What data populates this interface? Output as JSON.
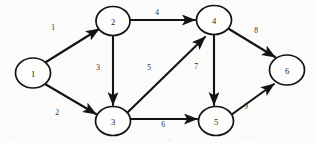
{
  "figure": {
    "type": "directed-weighted-graph",
    "background_color": "#fbfbfa",
    "ink_color": "#131313",
    "width": 317,
    "height": 143
  },
  "nodes": [
    {
      "id": "1",
      "label": "1",
      "cx": 33,
      "cy": 73,
      "rx": 17.5,
      "ry": 15.0
    },
    {
      "id": "2",
      "label": "2",
      "cx": 113,
      "cy": 21,
      "rx": 17.0,
      "ry": 14.5
    },
    {
      "id": "3",
      "label": "3",
      "cx": 113,
      "cy": 121,
      "rx": 17.5,
      "ry": 14.5
    },
    {
      "id": "4",
      "label": "4",
      "cx": 214,
      "cy": 20,
      "rx": 17.5,
      "ry": 14.5
    },
    {
      "id": "5",
      "label": "5",
      "cx": 216,
      "cy": 121,
      "rx": 17.5,
      "ry": 14.5
    },
    {
      "id": "6",
      "label": "6",
      "cx": 287,
      "cy": 70,
      "rx": 17.5,
      "ry": 15.0
    }
  ],
  "edges": [
    {
      "id": "e1",
      "from": "1",
      "to": "2",
      "weight": "1",
      "label_x": 53,
      "label_y": 27,
      "x1": 46,
      "y1": 62,
      "x2": 99,
      "y2": 29
    },
    {
      "id": "e2",
      "from": "1",
      "to": "3",
      "weight": "2",
      "label_x": 57,
      "label_y": 112,
      "x1": 45,
      "y1": 84,
      "x2": 96,
      "y2": 114
    },
    {
      "id": "e3",
      "from": "2",
      "to": "3",
      "weight": "3",
      "label_x": 98,
      "label_y": 67,
      "x1": 113,
      "y1": 36,
      "x2": 113,
      "y2": 105
    },
    {
      "id": "e4",
      "from": "2",
      "to": "4",
      "weight": "4",
      "label_x": 157,
      "label_y": 12,
      "x1": 130,
      "y1": 20,
      "x2": 195,
      "y2": 20
    },
    {
      "id": "e5",
      "from": "3",
      "to": "4",
      "weight": "5",
      "label_x": 149,
      "label_y": 67,
      "x1": 127,
      "y1": 113,
      "x2": 205,
      "y2": 37
    },
    {
      "id": "e6",
      "from": "3",
      "to": "5",
      "weight": "6",
      "label_x": 163,
      "label_y": 124,
      "x1": 131,
      "y1": 119,
      "x2": 197,
      "y2": 119
    },
    {
      "id": "e7",
      "from": "4",
      "to": "5",
      "weight": "7",
      "label_x": 196,
      "label_y": 66,
      "x1": 214,
      "y1": 35,
      "x2": 214,
      "y2": 105
    },
    {
      "id": "e8",
      "from": "4",
      "to": "6",
      "weight": "8",
      "label_x": 256,
      "label_y": 30,
      "x1": 229,
      "y1": 29,
      "x2": 275,
      "y2": 57
    },
    {
      "id": "e9",
      "from": "5",
      "to": "6",
      "weight": "9",
      "label_x": 246,
      "label_y": 106,
      "x1": 231,
      "y1": 115,
      "x2": 274,
      "y2": 84
    }
  ]
}
